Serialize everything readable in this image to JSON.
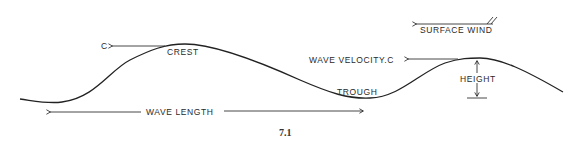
{
  "figure": {
    "number": "7.1",
    "labels": {
      "c": "C",
      "crest": "CREST",
      "trough": "TROUGH",
      "wave_length": "WAVE  LENGTH",
      "wave_velocity": "WAVE  VELOCITY.C",
      "height": "HEIGHT",
      "surface_wind": "SURFACE WIND"
    },
    "colors": {
      "ink": "#222222",
      "background": "#ffffff"
    }
  }
}
